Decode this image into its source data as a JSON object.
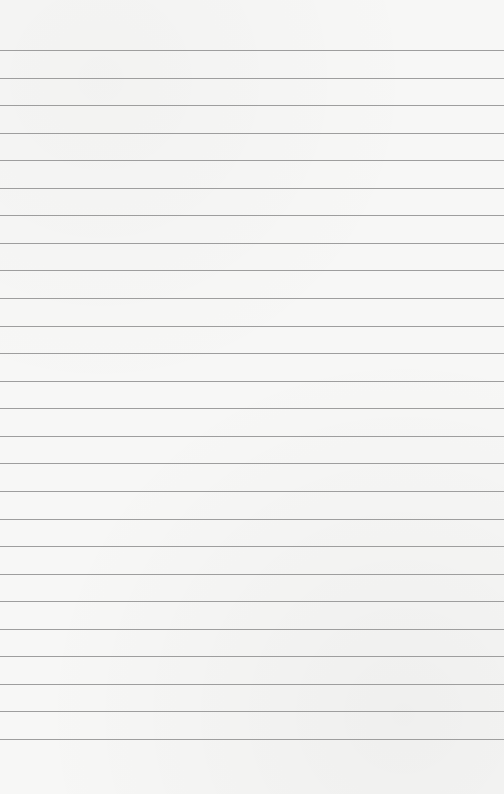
{
  "page": {
    "type": "lined-paper",
    "background_color": "#f7f7f6",
    "line_color": "#9e9e9e",
    "line_count": 26,
    "first_line_y": 50,
    "line_spacing": 27.56,
    "text": ""
  }
}
